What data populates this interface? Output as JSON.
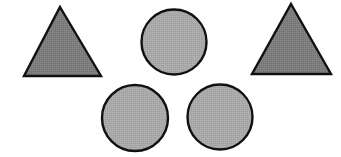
{
  "figure": {
    "description": "Five outlined gray geometric shapes arranged on a white background: two triangles and three circles",
    "canvas": {
      "width": 341,
      "height": 157,
      "background_color": "#ffffff"
    },
    "palette": {
      "triangle_fill": "#7d7d7d",
      "circle_fill": "#a9a9a9",
      "outline_color": "#111111",
      "background": "#ffffff"
    },
    "counts": {
      "total_shapes": 5,
      "triangles": 2,
      "circles": 3
    },
    "shapes": [
      {
        "id": "triangle-left",
        "type": "triangle",
        "label": "Triangle (left)",
        "fill": "#7d7d7d",
        "stroke": "#111111",
        "stroke_width": 2.4,
        "points": "60,7 101,76 24,76",
        "apex_x": 60,
        "apex_y": 7,
        "base_y": 76,
        "base_left_x": 24,
        "base_right_x": 101
      },
      {
        "id": "circle-top-center",
        "type": "circle",
        "label": "Circle (top center)",
        "fill": "#a9a9a9",
        "stroke": "#111111",
        "stroke_width": 2.4,
        "cx": 174,
        "cy": 42,
        "r": 32.5
      },
      {
        "id": "triangle-right",
        "type": "triangle",
        "label": "Triangle (right)",
        "fill": "#7d7d7d",
        "stroke": "#111111",
        "stroke_width": 2.4,
        "points": "291,4 331,74 252,74",
        "apex_x": 291,
        "apex_y": 4,
        "base_y": 74,
        "base_left_x": 252,
        "base_right_x": 331
      },
      {
        "id": "circle-bottom-left",
        "type": "circle",
        "label": "Circle (bottom left)",
        "fill": "#a9a9a9",
        "stroke": "#111111",
        "stroke_width": 2.4,
        "cx": 135,
        "cy": 118,
        "r": 33
      },
      {
        "id": "circle-bottom-right",
        "type": "circle",
        "label": "Circle (bottom right)",
        "fill": "#a9a9a9",
        "stroke": "#111111",
        "stroke_width": 2.4,
        "cx": 220,
        "cy": 117,
        "r": 32.5
      }
    ]
  }
}
